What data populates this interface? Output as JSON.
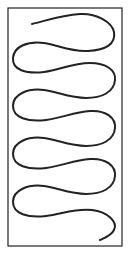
{
  "diagram": {
    "frame": {
      "x": 8,
      "y": 8,
      "width": 114,
      "height": 238,
      "stroke": "#222222",
      "stroke_width": 1.2
    },
    "curve": {
      "stroke": "#222222",
      "stroke_width": 2,
      "description": "Single continuous winding line making 5 left loops and 5 right loops, starting top-center and ending bottom-right",
      "start": [
        32,
        24
      ],
      "end": [
        100,
        240
      ],
      "left_turns": 5,
      "right_turns": 5
    },
    "background": "#ffffff"
  }
}
